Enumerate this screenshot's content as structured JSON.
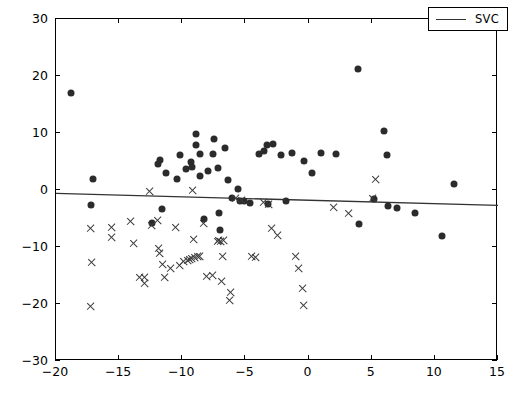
{
  "chart_data": {
    "type": "scatter",
    "title": "",
    "xlabel": "",
    "ylabel": "",
    "xlim": [
      -20,
      15
    ],
    "ylim": [
      -30,
      30
    ],
    "xticks": [
      -20,
      -15,
      -10,
      -5,
      0,
      5,
      10,
      15
    ],
    "yticks": [
      -30,
      -20,
      -10,
      0,
      10,
      20,
      30
    ],
    "xtick_labels": [
      "−20",
      "−15",
      "−10",
      "−5",
      "0",
      "5",
      "10",
      "15"
    ],
    "ytick_labels": [
      "−30",
      "−20",
      "−10",
      "0",
      "10",
      "20",
      "30"
    ],
    "grid": false,
    "legend_position": "upper right",
    "legend": [
      {
        "label": "SVC",
        "marker": "line",
        "color": "#333333"
      }
    ],
    "series": [
      {
        "name": "class-positive",
        "marker": "dot",
        "color": "#2b2b2b",
        "points": [
          [
            -18.8,
            17.1
          ],
          [
            -17.1,
            2.0
          ],
          [
            -17.2,
            -2.6
          ],
          [
            -12.4,
            -5.8
          ],
          [
            -11.6,
            -3.3
          ],
          [
            -11.9,
            4.5
          ],
          [
            -11.8,
            5.3
          ],
          [
            -11.3,
            2.9
          ],
          [
            -10.4,
            1.9
          ],
          [
            -10.2,
            6.2
          ],
          [
            -9.7,
            3.6
          ],
          [
            -9.3,
            5.0
          ],
          [
            -9.2,
            4.1
          ],
          [
            -8.9,
            9.9
          ],
          [
            -8.9,
            7.9
          ],
          [
            -8.6,
            6.3
          ],
          [
            -8.6,
            2.5
          ],
          [
            -8.3,
            -5.1
          ],
          [
            -8.0,
            3.3
          ],
          [
            -7.6,
            6.4
          ],
          [
            -7.5,
            9.0
          ],
          [
            -7.2,
            3.8
          ],
          [
            -7.1,
            -4.0
          ],
          [
            -7.0,
            -7.1
          ],
          [
            -6.6,
            7.4
          ],
          [
            -6.4,
            1.8
          ],
          [
            -6.1,
            -1.4
          ],
          [
            -5.6,
            0.2
          ],
          [
            -5.4,
            -1.9
          ],
          [
            -5.1,
            -2.0
          ],
          [
            -4.6,
            -2.3
          ],
          [
            -3.9,
            6.3
          ],
          [
            -3.5,
            6.9
          ],
          [
            -3.3,
            7.9
          ],
          [
            -3.2,
            -2.4
          ],
          [
            -2.8,
            8.0
          ],
          [
            -2.2,
            6.1
          ],
          [
            -1.8,
            -2.0
          ],
          [
            -1.3,
            6.5
          ],
          [
            -0.4,
            5.1
          ],
          [
            0.3,
            3.0
          ],
          [
            1.0,
            6.5
          ],
          [
            2.2,
            6.4
          ],
          [
            3.9,
            21.3
          ],
          [
            4.0,
            -5.9
          ],
          [
            5.2,
            -1.6
          ],
          [
            6.0,
            10.4
          ],
          [
            6.2,
            6.1
          ],
          [
            6.3,
            -2.8
          ],
          [
            7.0,
            -3.1
          ],
          [
            8.4,
            -4.1
          ],
          [
            10.6,
            -8.1
          ],
          [
            11.5,
            1.1
          ]
        ]
      },
      {
        "name": "class-negative",
        "marker": "cross",
        "color": "#3a3a3a",
        "points": [
          [
            -17.3,
            -6.8
          ],
          [
            -17.2,
            -12.8
          ],
          [
            -17.3,
            -20.4
          ],
          [
            -15.6,
            -6.5
          ],
          [
            -15.6,
            -8.4
          ],
          [
            -14.1,
            -5.5
          ],
          [
            -13.9,
            -9.3
          ],
          [
            -13.4,
            -15.4
          ],
          [
            -13.0,
            -15.3
          ],
          [
            -13.0,
            -16.4
          ],
          [
            -12.6,
            -0.2
          ],
          [
            -12.4,
            -6.2
          ],
          [
            -12.0,
            -5.4
          ],
          [
            -11.9,
            -10.2
          ],
          [
            -11.8,
            -11.1
          ],
          [
            -11.6,
            -13.0
          ],
          [
            -11.4,
            -15.3
          ],
          [
            -10.9,
            -13.7
          ],
          [
            -10.5,
            -6.6
          ],
          [
            -10.2,
            -13.2
          ],
          [
            -9.9,
            -12.6
          ],
          [
            -9.6,
            -12.4
          ],
          [
            -9.4,
            -12.2
          ],
          [
            -9.3,
            -12.1
          ],
          [
            -9.2,
            -0.1
          ],
          [
            -9.1,
            -8.6
          ],
          [
            -9.0,
            -11.8
          ],
          [
            -8.8,
            -11.7
          ],
          [
            -8.6,
            -11.6
          ],
          [
            -8.3,
            -5.9
          ],
          [
            -8.1,
            -15.1
          ],
          [
            -7.6,
            -15.0
          ],
          [
            -7.2,
            -9.0
          ],
          [
            -7.1,
            -8.9
          ],
          [
            -7.0,
            -9.1
          ],
          [
            -6.9,
            -16.0
          ],
          [
            -6.8,
            -11.7
          ],
          [
            -6.7,
            -8.8
          ],
          [
            -6.3,
            -19.3
          ],
          [
            -6.2,
            -18.0
          ],
          [
            -5.8,
            -1.5
          ],
          [
            -5.3,
            -1.9
          ],
          [
            -4.5,
            -11.6
          ],
          [
            -4.2,
            -11.9
          ],
          [
            -3.6,
            -2.2
          ],
          [
            -3.2,
            -2.5
          ],
          [
            -2.9,
            -6.8
          ],
          [
            -2.5,
            -8.0
          ],
          [
            -1.0,
            -11.7
          ],
          [
            -0.8,
            -13.8
          ],
          [
            -0.5,
            -17.2
          ],
          [
            -0.4,
            -20.3
          ],
          [
            2.0,
            -3.1
          ],
          [
            3.2,
            -4.2
          ],
          [
            5.1,
            -1.5
          ],
          [
            5.3,
            1.8
          ]
        ]
      }
    ],
    "decision_line": {
      "label": "SVC",
      "color": "#333333",
      "x": [
        -20,
        15
      ],
      "y": [
        -0.6,
        -2.7
      ]
    }
  }
}
